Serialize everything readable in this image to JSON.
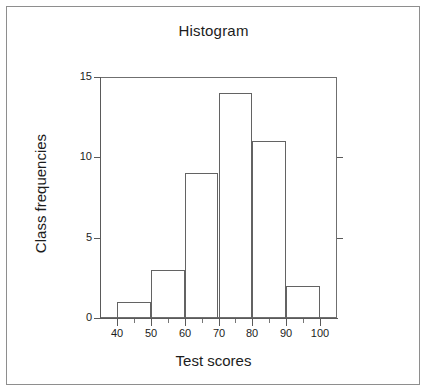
{
  "chart_data": {
    "type": "bar",
    "title": "Histogram",
    "xlabel": "Test scores",
    "ylabel": "Class frequencies",
    "categories": [
      "40-50",
      "50-60",
      "60-70",
      "70-80",
      "80-90",
      "90-100"
    ],
    "bin_edges": [
      40,
      50,
      60,
      70,
      80,
      90,
      100
    ],
    "values": [
      1,
      3,
      9,
      14,
      11,
      2
    ],
    "xlim": [
      35,
      105
    ],
    "ylim": [
      0,
      15
    ],
    "x_ticks": [
      40,
      50,
      60,
      70,
      80,
      90,
      100
    ],
    "x_tick_labels": [
      "40",
      "50",
      "60",
      "70",
      "80",
      "90",
      "100"
    ],
    "x_minor_ticks": [
      45,
      55,
      65,
      75,
      85,
      95
    ],
    "y_ticks": [
      0,
      5,
      10,
      15
    ],
    "y_tick_labels": [
      "0",
      "5",
      "10",
      "15"
    ],
    "grid": false,
    "legend": null,
    "bar_fill": "none",
    "bar_edge_color": "#636363",
    "axis_color": "#5a5a5a",
    "text_color": "#1c1c1c",
    "background": "#ffffff"
  }
}
